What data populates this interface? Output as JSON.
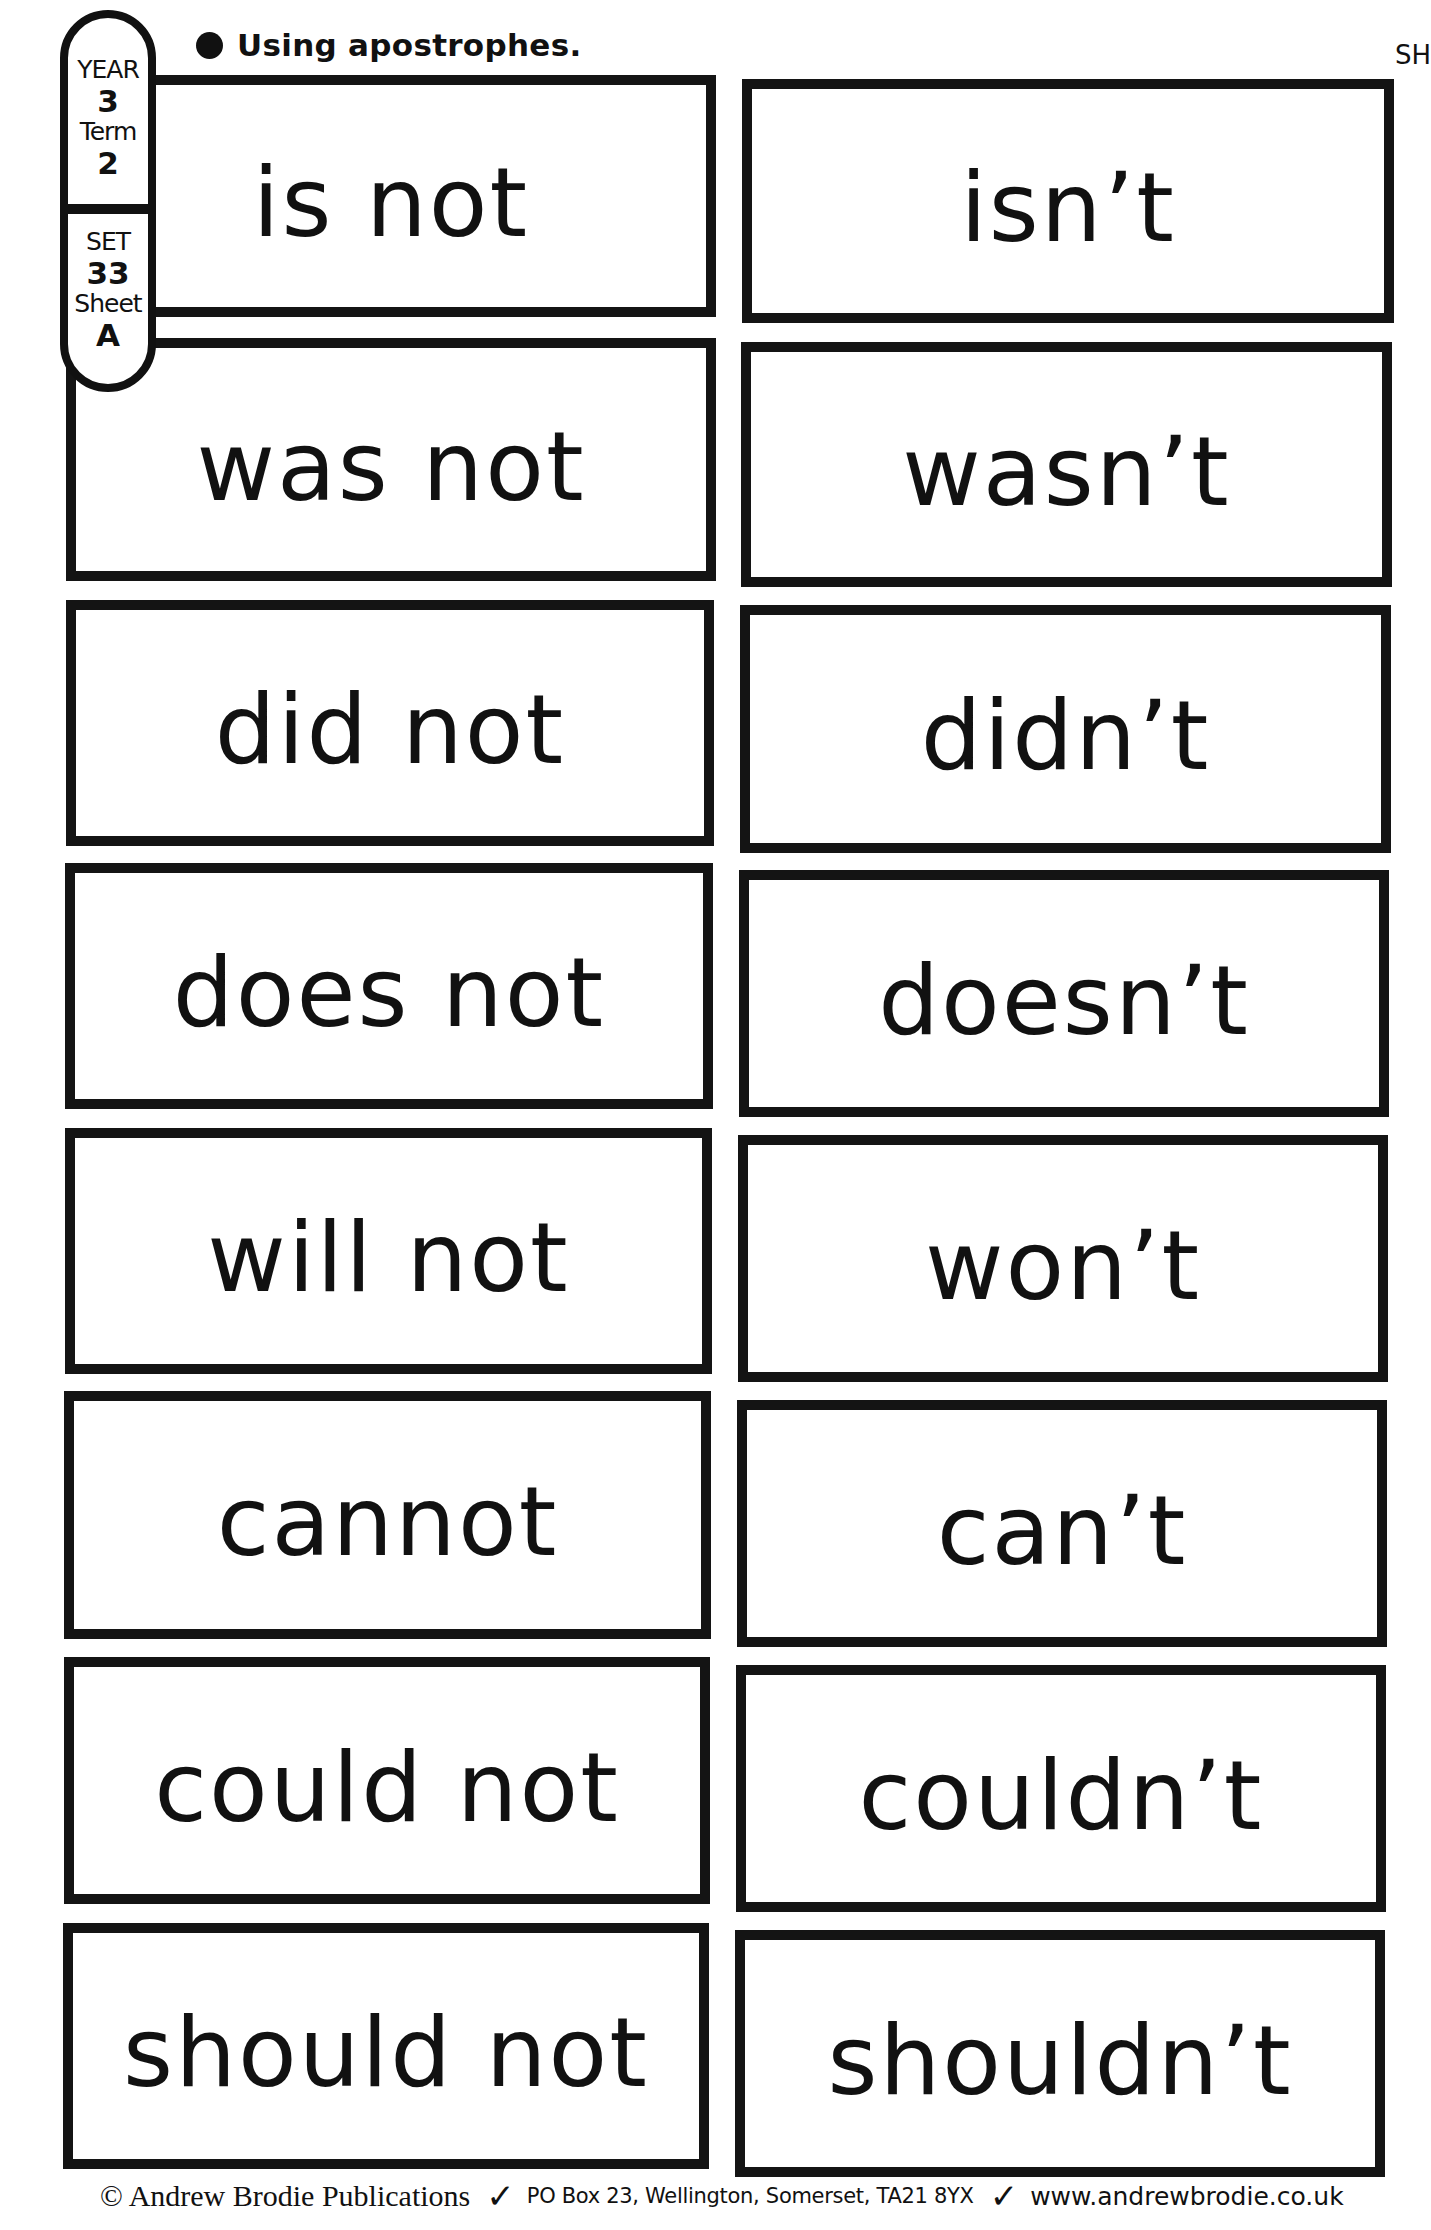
{
  "header": {
    "heading": "Using apostrophes.",
    "edge_fragment": "SH"
  },
  "tab": {
    "year_label": "YEAR",
    "year_value": "3",
    "term_label": "Term",
    "term_value": "2",
    "set_label": "SET",
    "set_value": "33",
    "sheet_label": "Sheet",
    "sheet_value": "A"
  },
  "cards": {
    "left": [
      "is not",
      "was not",
      "did not",
      "does not",
      "will not",
      "cannot",
      "could not",
      "should not"
    ],
    "right": [
      "isn’t",
      "wasn’t",
      "didn’t",
      "doesn’t",
      "won’t",
      "can’t",
      "couldn’t",
      "shouldn’t"
    ]
  },
  "footer": {
    "copyright": "© Andrew Brodie Publications",
    "tick": "✓",
    "address": "PO Box 23, Wellington, Somerset, TA21 8YX",
    "website": "www.andrewbrodie.co.uk"
  },
  "colors": {
    "ink": "#111111",
    "paper": "#ffffff"
  }
}
